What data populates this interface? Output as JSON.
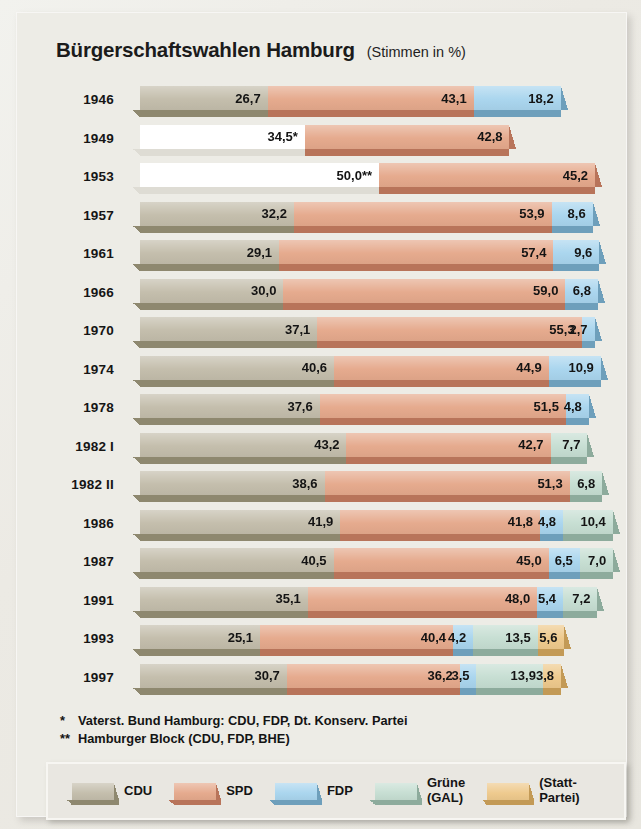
{
  "header": {
    "title": "Bürgerschaftswahlen Hamburg",
    "subtitle": "(Stimmen in %)"
  },
  "footnotes": {
    "one_mark": "*",
    "one_text": "Vaterst. Bund Hamburg: CDU, FDP, Dt. Konserv. Partei",
    "two_mark": "**",
    "two_text": "Hamburger Block (CDU, FDP, BHE)"
  },
  "legend": {
    "items": [
      {
        "label": "CDU",
        "color": "#c3bdab",
        "dark": "#8e886f"
      },
      {
        "label": "SPD",
        "color": "#e5a98c",
        "dark": "#b8745a"
      },
      {
        "label": "FDP",
        "color": "#a9d5ee",
        "dark": "#6e9fbb"
      },
      {
        "label": "Grüne\n(GAL)",
        "color": "#c6ded2",
        "dark": "#8dab9c"
      },
      {
        "label": "(Statt-\nPartei)",
        "color": "#eec98c",
        "dark": "#c39a56"
      }
    ]
  },
  "chart_data": {
    "type": "bar",
    "orientation": "horizontal",
    "stacked": true,
    "title": "Bürgerschaftswahlen Hamburg",
    "subtitle": "(Stimmen in %)",
    "xlabel": "",
    "ylabel": "",
    "xlim": [
      0,
      100
    ],
    "grid": false,
    "legend_position": "bottom",
    "categories": [
      "1946",
      "1949",
      "1953",
      "1957",
      "1961",
      "1966",
      "1970",
      "1974",
      "1978",
      "1982 I",
      "1982 II",
      "1986",
      "1987",
      "1991",
      "1993",
      "1997"
    ],
    "series": [
      {
        "name": "CDU",
        "color": "#c3bdab",
        "values": [
          26.7,
          34.5,
          50.0,
          32.2,
          29.1,
          30.0,
          37.1,
          40.6,
          37.6,
          43.2,
          38.6,
          41.9,
          40.5,
          35.1,
          25.1,
          30.7
        ]
      },
      {
        "name": "SPD",
        "color": "#e5a98c",
        "values": [
          43.1,
          42.8,
          45.2,
          53.9,
          57.4,
          59.0,
          55.3,
          44.9,
          51.5,
          42.7,
          51.3,
          41.8,
          45.0,
          48.0,
          40.4,
          36.2
        ]
      },
      {
        "name": "FDP",
        "color": "#a9d5ee",
        "values": [
          18.2,
          null,
          null,
          8.6,
          9.6,
          6.8,
          2.7,
          10.9,
          4.8,
          null,
          null,
          4.8,
          6.5,
          5.4,
          4.2,
          3.5
        ]
      },
      {
        "name": "Grüne (GAL)",
        "color": "#c6ded2",
        "values": [
          null,
          null,
          null,
          null,
          null,
          null,
          null,
          null,
          null,
          7.7,
          6.8,
          10.4,
          7.0,
          7.2,
          13.5,
          13.9
        ]
      },
      {
        "name": "(Statt-Partei)",
        "color": "#eec98c",
        "values": [
          null,
          null,
          null,
          null,
          null,
          null,
          null,
          null,
          null,
          null,
          null,
          null,
          null,
          null,
          5.6,
          3.8
        ]
      }
    ],
    "rows": [
      {
        "year": "1946",
        "segments": [
          {
            "party": "CDU",
            "value": "26,7",
            "num": 26.7,
            "color": "#c3bdab",
            "dark": "#8e886f",
            "blank": false
          },
          {
            "party": "SPD",
            "value": "43,1",
            "num": 43.1,
            "color": "#e5a98c",
            "dark": "#b8745a",
            "blank": false
          },
          {
            "party": "FDP",
            "value": "18,2",
            "num": 18.2,
            "color": "#a9d5ee",
            "dark": "#6e9fbb",
            "blank": false
          }
        ]
      },
      {
        "year": "1949",
        "segments": [
          {
            "party": "CDU",
            "value": "34,5*",
            "num": 34.5,
            "color": "#ffffff",
            "dark": "#dedcd4",
            "blank": true
          },
          {
            "party": "SPD",
            "value": "42,8",
            "num": 42.8,
            "color": "#e5a98c",
            "dark": "#b8745a",
            "blank": false
          }
        ]
      },
      {
        "year": "1953",
        "segments": [
          {
            "party": "CDU",
            "value": "50,0**",
            "num": 50.0,
            "color": "#ffffff",
            "dark": "#dedcd4",
            "blank": true
          },
          {
            "party": "SPD",
            "value": "45,2",
            "num": 45.2,
            "color": "#e5a98c",
            "dark": "#b8745a",
            "blank": false
          }
        ]
      },
      {
        "year": "1957",
        "segments": [
          {
            "party": "CDU",
            "value": "32,2",
            "num": 32.2,
            "color": "#c3bdab",
            "dark": "#8e886f",
            "blank": false
          },
          {
            "party": "SPD",
            "value": "53,9",
            "num": 53.9,
            "color": "#e5a98c",
            "dark": "#b8745a",
            "blank": false
          },
          {
            "party": "FDP",
            "value": "8,6",
            "num": 8.6,
            "color": "#a9d5ee",
            "dark": "#6e9fbb",
            "blank": false
          }
        ]
      },
      {
        "year": "1961",
        "segments": [
          {
            "party": "CDU",
            "value": "29,1",
            "num": 29.1,
            "color": "#c3bdab",
            "dark": "#8e886f",
            "blank": false
          },
          {
            "party": "SPD",
            "value": "57,4",
            "num": 57.4,
            "color": "#e5a98c",
            "dark": "#b8745a",
            "blank": false
          },
          {
            "party": "FDP",
            "value": "9,6",
            "num": 9.6,
            "color": "#a9d5ee",
            "dark": "#6e9fbb",
            "blank": false
          }
        ]
      },
      {
        "year": "1966",
        "segments": [
          {
            "party": "CDU",
            "value": "30,0",
            "num": 30.0,
            "color": "#c3bdab",
            "dark": "#8e886f",
            "blank": false
          },
          {
            "party": "SPD",
            "value": "59,0",
            "num": 59.0,
            "color": "#e5a98c",
            "dark": "#b8745a",
            "blank": false
          },
          {
            "party": "FDP",
            "value": "6,8",
            "num": 6.8,
            "color": "#a9d5ee",
            "dark": "#6e9fbb",
            "blank": false
          }
        ]
      },
      {
        "year": "1970",
        "segments": [
          {
            "party": "CDU",
            "value": "37,1",
            "num": 37.1,
            "color": "#c3bdab",
            "dark": "#8e886f",
            "blank": false
          },
          {
            "party": "SPD",
            "value": "55,3",
            "num": 55.3,
            "color": "#e5a98c",
            "dark": "#b8745a",
            "blank": false
          },
          {
            "party": "FDP",
            "value": "2,7",
            "num": 2.7,
            "color": "#a9d5ee",
            "dark": "#6e9fbb",
            "blank": false
          }
        ]
      },
      {
        "year": "1974",
        "segments": [
          {
            "party": "CDU",
            "value": "40,6",
            "num": 40.6,
            "color": "#c3bdab",
            "dark": "#8e886f",
            "blank": false
          },
          {
            "party": "SPD",
            "value": "44,9",
            "num": 44.9,
            "color": "#e5a98c",
            "dark": "#b8745a",
            "blank": false
          },
          {
            "party": "FDP",
            "value": "10,9",
            "num": 10.9,
            "color": "#a9d5ee",
            "dark": "#6e9fbb",
            "blank": false
          }
        ]
      },
      {
        "year": "1978",
        "segments": [
          {
            "party": "CDU",
            "value": "37,6",
            "num": 37.6,
            "color": "#c3bdab",
            "dark": "#8e886f",
            "blank": false
          },
          {
            "party": "SPD",
            "value": "51,5",
            "num": 51.5,
            "color": "#e5a98c",
            "dark": "#b8745a",
            "blank": false
          },
          {
            "party": "FDP",
            "value": "4,8",
            "num": 4.8,
            "color": "#a9d5ee",
            "dark": "#6e9fbb",
            "blank": false
          }
        ]
      },
      {
        "year": "1982 I",
        "segments": [
          {
            "party": "CDU",
            "value": "43,2",
            "num": 43.2,
            "color": "#c3bdab",
            "dark": "#8e886f",
            "blank": false
          },
          {
            "party": "SPD",
            "value": "42,7",
            "num": 42.7,
            "color": "#e5a98c",
            "dark": "#b8745a",
            "blank": false
          },
          {
            "party": "Grüne (GAL)",
            "value": "7,7",
            "num": 7.7,
            "color": "#c6ded2",
            "dark": "#8dab9c",
            "blank": false
          }
        ]
      },
      {
        "year": "1982 II",
        "segments": [
          {
            "party": "CDU",
            "value": "38,6",
            "num": 38.6,
            "color": "#c3bdab",
            "dark": "#8e886f",
            "blank": false
          },
          {
            "party": "SPD",
            "value": "51,3",
            "num": 51.3,
            "color": "#e5a98c",
            "dark": "#b8745a",
            "blank": false
          },
          {
            "party": "Grüne (GAL)",
            "value": "6,8",
            "num": 6.8,
            "color": "#c6ded2",
            "dark": "#8dab9c",
            "blank": false
          }
        ]
      },
      {
        "year": "1986",
        "segments": [
          {
            "party": "CDU",
            "value": "41,9",
            "num": 41.9,
            "color": "#c3bdab",
            "dark": "#8e886f",
            "blank": false
          },
          {
            "party": "SPD",
            "value": "41,8",
            "num": 41.8,
            "color": "#e5a98c",
            "dark": "#b8745a",
            "blank": false
          },
          {
            "party": "FDP",
            "value": "4,8",
            "num": 4.8,
            "color": "#a9d5ee",
            "dark": "#6e9fbb",
            "blank": false
          },
          {
            "party": "Grüne (GAL)",
            "value": "10,4",
            "num": 10.4,
            "color": "#c6ded2",
            "dark": "#8dab9c",
            "blank": false
          }
        ]
      },
      {
        "year": "1987",
        "segments": [
          {
            "party": "CDU",
            "value": "40,5",
            "num": 40.5,
            "color": "#c3bdab",
            "dark": "#8e886f",
            "blank": false
          },
          {
            "party": "SPD",
            "value": "45,0",
            "num": 45.0,
            "color": "#e5a98c",
            "dark": "#b8745a",
            "blank": false
          },
          {
            "party": "FDP",
            "value": "6,5",
            "num": 6.5,
            "color": "#a9d5ee",
            "dark": "#6e9fbb",
            "blank": false
          },
          {
            "party": "Grüne (GAL)",
            "value": "7,0",
            "num": 7.0,
            "color": "#c6ded2",
            "dark": "#8dab9c",
            "blank": false
          }
        ]
      },
      {
        "year": "1991",
        "segments": [
          {
            "party": "CDU",
            "value": "35,1",
            "num": 35.1,
            "color": "#c3bdab",
            "dark": "#8e886f",
            "blank": false
          },
          {
            "party": "SPD",
            "value": "48,0",
            "num": 48.0,
            "color": "#e5a98c",
            "dark": "#b8745a",
            "blank": false
          },
          {
            "party": "FDP",
            "value": "5,4",
            "num": 5.4,
            "color": "#a9d5ee",
            "dark": "#6e9fbb",
            "blank": false
          },
          {
            "party": "Grüne (GAL)",
            "value": "7,2",
            "num": 7.2,
            "color": "#c6ded2",
            "dark": "#8dab9c",
            "blank": false
          }
        ]
      },
      {
        "year": "1993",
        "segments": [
          {
            "party": "CDU",
            "value": "25,1",
            "num": 25.1,
            "color": "#c3bdab",
            "dark": "#8e886f",
            "blank": false
          },
          {
            "party": "SPD",
            "value": "40,4",
            "num": 40.4,
            "color": "#e5a98c",
            "dark": "#b8745a",
            "blank": false
          },
          {
            "party": "FDP",
            "value": "4,2",
            "num": 4.2,
            "color": "#a9d5ee",
            "dark": "#6e9fbb",
            "blank": false
          },
          {
            "party": "Grüne (GAL)",
            "value": "13,5",
            "num": 13.5,
            "color": "#c6ded2",
            "dark": "#8dab9c",
            "blank": false
          },
          {
            "party": "(Statt-Partei)",
            "value": "5,6",
            "num": 5.6,
            "color": "#eec98c",
            "dark": "#c39a56",
            "blank": false
          }
        ]
      },
      {
        "year": "1997",
        "segments": [
          {
            "party": "CDU",
            "value": "30,7",
            "num": 30.7,
            "color": "#c3bdab",
            "dark": "#8e886f",
            "blank": false
          },
          {
            "party": "SPD",
            "value": "36,2",
            "num": 36.2,
            "color": "#e5a98c",
            "dark": "#b8745a",
            "blank": false
          },
          {
            "party": "FDP",
            "value": "3,5",
            "num": 3.5,
            "color": "#a9d5ee",
            "dark": "#6e9fbb",
            "blank": false
          },
          {
            "party": "Grüne (GAL)",
            "value": "13,9",
            "num": 13.9,
            "color": "#c6ded2",
            "dark": "#8dab9c",
            "blank": false
          },
          {
            "party": "(Statt-Partei)",
            "value": "3,8",
            "num": 3.8,
            "color": "#eec98c",
            "dark": "#c39a56",
            "blank": false
          }
        ]
      }
    ]
  }
}
